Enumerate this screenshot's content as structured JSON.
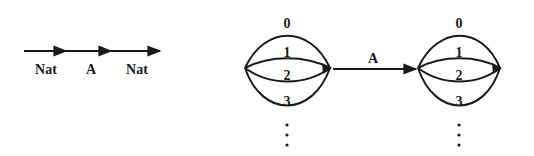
{
  "diagram": {
    "left_chain": {
      "labels": [
        "Nat",
        "A",
        "Nat"
      ]
    },
    "cluster_left": {
      "arc_labels": [
        "0",
        "1",
        "2",
        "3"
      ],
      "continuation": "⋮"
    },
    "middle_arrow": {
      "label": "A"
    },
    "cluster_right": {
      "arc_labels": [
        "0",
        "1",
        "2",
        "3"
      ],
      "continuation": "⋮"
    }
  },
  "colors": {
    "stroke": "#1a1a1a",
    "background": "#ffffff"
  }
}
